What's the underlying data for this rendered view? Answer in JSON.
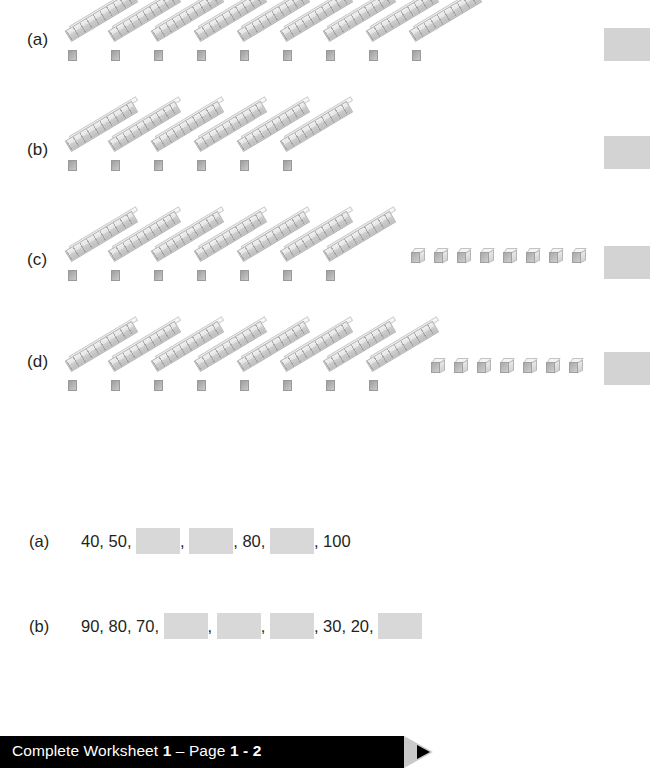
{
  "page": {
    "background": "#ffffff",
    "ink": "#231f20",
    "answer_box_color": "#d3d3d3",
    "blank_box_color": "#d8d8d8"
  },
  "blocks_question": {
    "rows": [
      {
        "label": "(a)",
        "tens_rods": 9,
        "unit_cubes": 0,
        "value": 90,
        "label_top": 30,
        "row_top": 0,
        "rods_left": 68,
        "rod_gap": 43,
        "cubes_left": 0,
        "cube_gap": 0,
        "answer_left": 604,
        "answer_top": 28
      },
      {
        "label": "(b)",
        "tens_rods": 6,
        "unit_cubes": 0,
        "value": 60,
        "label_top": 140,
        "row_top": 110,
        "rods_left": 68,
        "rod_gap": 43,
        "cubes_left": 0,
        "cube_gap": 0,
        "answer_left": 604,
        "answer_top": 136
      },
      {
        "label": "(c)",
        "tens_rods": 7,
        "unit_cubes": 8,
        "value": 78,
        "label_top": 250,
        "row_top": 220,
        "rods_left": 68,
        "rod_gap": 43,
        "cubes_left": 411,
        "cube_gap": 23,
        "answer_left": 604,
        "answer_top": 246
      },
      {
        "label": "(d)",
        "tens_rods": 8,
        "unit_cubes": 7,
        "value": 87,
        "label_top": 352,
        "row_top": 330,
        "rods_left": 68,
        "rod_gap": 43,
        "cubes_left": 431,
        "cube_gap": 23,
        "answer_left": 604,
        "answer_top": 352
      }
    ]
  },
  "missing_numbers_question": {
    "prompt": "Write the missing numbers.",
    "bullet": "filled-circle",
    "rows": [
      {
        "label": "(a)",
        "top": 528,
        "items": [
          "40",
          "50",
          "",
          "",
          "80",
          "",
          "100"
        ]
      },
      {
        "label": "(b)",
        "top": 613,
        "items": [
          "90",
          "80",
          "70",
          "",
          "",
          "",
          "30",
          "20",
          ""
        ]
      }
    ]
  },
  "footer": {
    "prefix": "Complete Worksheet ",
    "worksheet_number": "1",
    "separator": " – Page ",
    "page_range": "1 - 2",
    "bar_color": "#000000",
    "arrow_color": "#c9c9c9"
  }
}
